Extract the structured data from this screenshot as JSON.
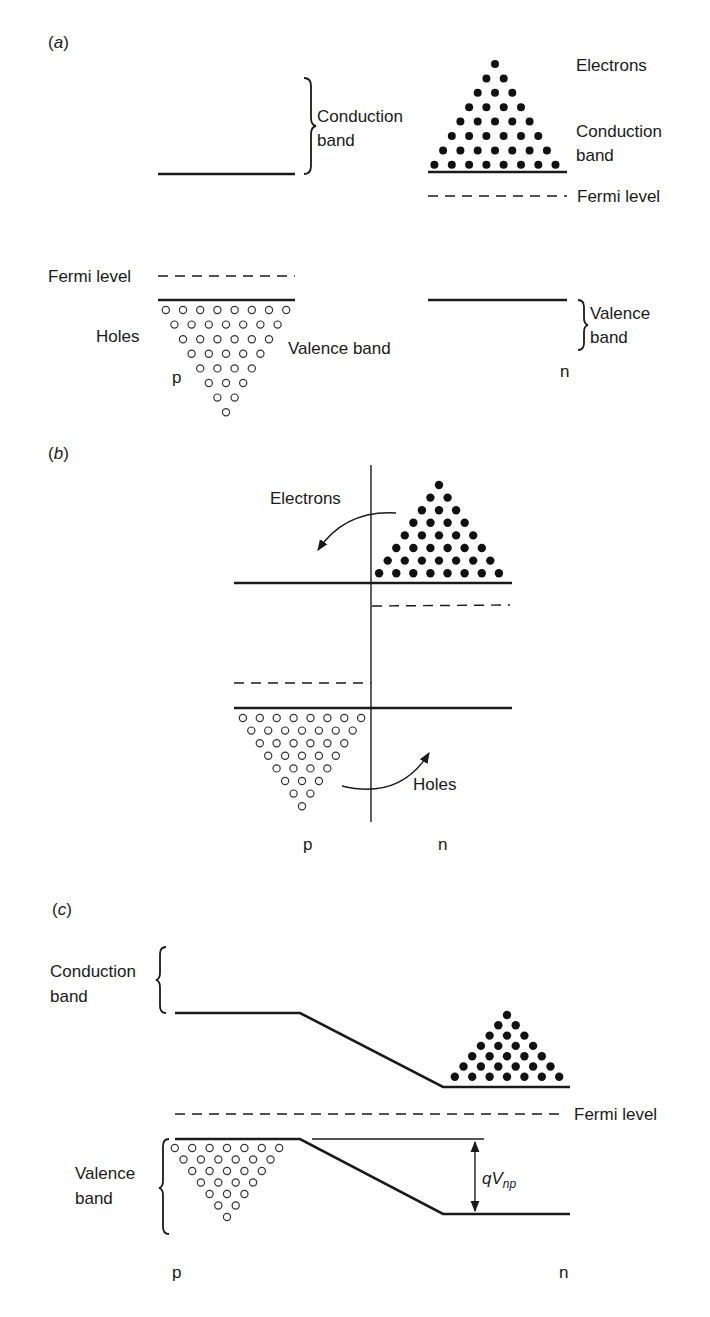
{
  "figure": {
    "panels": [
      {
        "id": "a",
        "label_open": "(",
        "label_letter": "a",
        "label_close": ")",
        "labels": {
          "conduction_band_p_line1": "Conduction",
          "conduction_band_p_line2": "band",
          "electrons": "Electrons",
          "conduction_band_n_line1": "Conduction",
          "conduction_band_n_line2": "band",
          "fermi_level_n": "Fermi level",
          "fermi_level_p": "Fermi level",
          "holes": "Holes",
          "valence_band_p": "Valence band",
          "valence_band_n_line1": "Valence",
          "valence_band_n_line2": "band",
          "p_side": "p",
          "n_side": "n"
        },
        "electron_rows": [
          1,
          2,
          3,
          4,
          5,
          6,
          7,
          8
        ],
        "hole_rows": [
          8,
          7,
          6,
          5,
          4,
          3,
          2,
          1
        ]
      },
      {
        "id": "b",
        "label_open": "(",
        "label_letter": "b",
        "label_close": ")",
        "labels": {
          "electrons": "Electrons",
          "holes": "Holes",
          "p_side": "p",
          "n_side": "n"
        },
        "electron_rows": [
          1,
          2,
          3,
          4,
          5,
          6,
          7,
          8
        ],
        "hole_rows": [
          8,
          7,
          6,
          5,
          4,
          3,
          2,
          1
        ]
      },
      {
        "id": "c",
        "label_open": "(",
        "label_letter": "c",
        "label_close": ")",
        "labels": {
          "conduction_band_line1": "Conduction",
          "conduction_band_line2": "band",
          "fermi_level": "Fermi level",
          "valence_band_line1": "Valence",
          "valence_band_line2": "band",
          "potential_q": "q",
          "potential_v": "V",
          "potential_sub": "np",
          "p_side": "p",
          "n_side": "n"
        },
        "electron_rows": [
          1,
          2,
          3,
          4,
          5,
          6,
          7
        ],
        "hole_rows": [
          7,
          6,
          5,
          4,
          3,
          2,
          1
        ]
      }
    ]
  }
}
